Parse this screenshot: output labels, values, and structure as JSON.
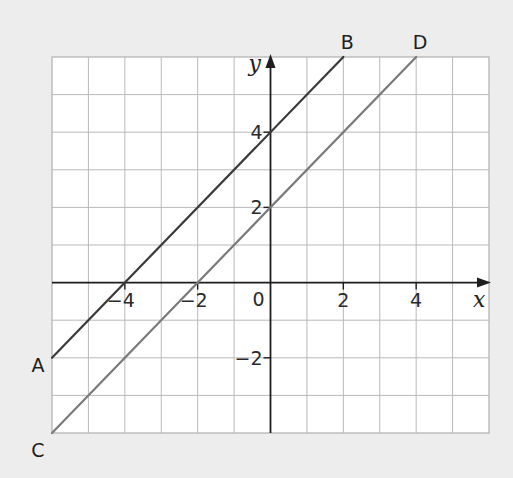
{
  "chart_data": {
    "type": "line",
    "title": "",
    "xlabel": "x",
    "ylabel": "y",
    "xlim": [
      -6,
      6
    ],
    "ylim": [
      -4,
      6
    ],
    "grid": true,
    "grid_step": 1,
    "origin_label": "0",
    "x_ticks": [
      {
        "value": -4,
        "label": "−4"
      },
      {
        "value": -2,
        "label": "−2"
      },
      {
        "value": 2,
        "label": "2"
      },
      {
        "value": 4,
        "label": "4"
      }
    ],
    "y_ticks": [
      {
        "value": 4,
        "label": "4"
      },
      {
        "value": 2,
        "label": "2"
      },
      {
        "value": -2,
        "label": "−2"
      }
    ],
    "series": [
      {
        "name": "AB",
        "equation": "y = x + 4",
        "color": "#3a3a3a",
        "points": [
          {
            "x": -6,
            "y": -2,
            "label": "A"
          },
          {
            "x": 2,
            "y": 6,
            "label": "B"
          }
        ]
      },
      {
        "name": "CD",
        "equation": "y = x + 2",
        "color": "#7a7a7a",
        "points": [
          {
            "x": -6,
            "y": -4,
            "label": "C"
          },
          {
            "x": 4,
            "y": 6,
            "label": "D"
          }
        ]
      }
    ]
  }
}
